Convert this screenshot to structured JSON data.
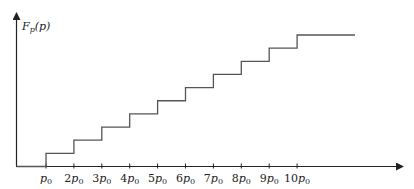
{
  "chart_data": {
    "type": "line",
    "subtype": "step",
    "title": "",
    "xlabel": "",
    "ylabel": "F_p(p)",
    "ylabel_display": {
      "main": "F",
      "sub": "p",
      "arg": "(p)"
    },
    "x_tick_labels": [
      "p0",
      "2p0",
      "3p0",
      "4p0",
      "5p0",
      "6p0",
      "7p0",
      "8p0",
      "9p0",
      "10p0"
    ],
    "x_tick_display": [
      {
        "coef": "",
        "sym": "p",
        "sub": "0"
      },
      {
        "coef": "2",
        "sym": "p",
        "sub": "0"
      },
      {
        "coef": "3",
        "sym": "p",
        "sub": "0"
      },
      {
        "coef": "4",
        "sym": "p",
        "sub": "0"
      },
      {
        "coef": "5",
        "sym": "p",
        "sub": "0"
      },
      {
        "coef": "6",
        "sym": "p",
        "sub": "0"
      },
      {
        "coef": "7",
        "sym": "p",
        "sub": "0"
      },
      {
        "coef": "8",
        "sym": "p",
        "sub": "0"
      },
      {
        "coef": "9",
        "sym": "p",
        "sub": "0"
      },
      {
        "coef": "10",
        "sym": "p",
        "sub": "0"
      }
    ],
    "x": [
      1,
      2,
      3,
      4,
      5,
      6,
      7,
      8,
      9,
      10
    ],
    "series": [
      {
        "name": "F_p(p)",
        "values": [
          1,
          2,
          3,
          4,
          5,
          6,
          7,
          8,
          9,
          10
        ],
        "extends_to_x": 12
      }
    ],
    "axis_units": "multiples of p0",
    "grid": false,
    "legend": null,
    "colors": {
      "axis": "#222222",
      "step_line": "#555555"
    }
  }
}
